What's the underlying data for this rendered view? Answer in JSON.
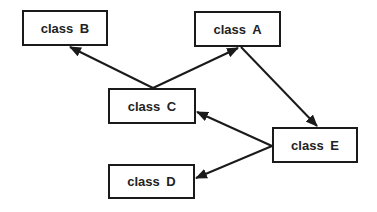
{
  "diagram": {
    "type": "class-dependency-graph",
    "nodes": [
      {
        "id": "B",
        "label": "class  B",
        "x": 22,
        "y": 10,
        "w": 86,
        "h": 36
      },
      {
        "id": "A",
        "label": "class  A",
        "x": 194,
        "y": 11,
        "w": 87,
        "h": 36
      },
      {
        "id": "C",
        "label": "class  C",
        "x": 108,
        "y": 88,
        "w": 88,
        "h": 36
      },
      {
        "id": "D",
        "label": "class  D",
        "x": 108,
        "y": 164,
        "w": 87,
        "h": 35
      },
      {
        "id": "E",
        "label": "class  E",
        "x": 272,
        "y": 127,
        "w": 86,
        "h": 36
      }
    ],
    "edges": [
      {
        "from": "C",
        "to": "B"
      },
      {
        "from": "C",
        "to": "A"
      },
      {
        "from": "A",
        "to": "E"
      },
      {
        "from": "E",
        "to": "C"
      },
      {
        "from": "E",
        "to": "D"
      }
    ],
    "colors": {
      "line": "#1a1a1a",
      "text": "#222222",
      "background": "#ffffff"
    }
  }
}
